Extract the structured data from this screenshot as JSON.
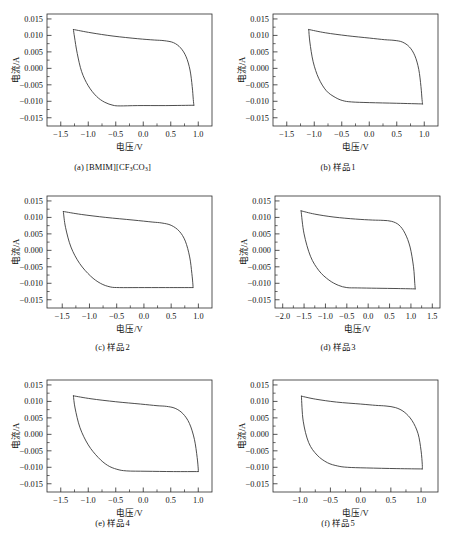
{
  "figure": {
    "axis_labels": {
      "x": "电压/V",
      "y": "电流/A"
    },
    "bottom_caption": ""
  },
  "chart_data": [
    {
      "type": "line",
      "panel": "a",
      "caption_prefix": "(a)",
      "caption": "[BMIM][CF3CO3]",
      "caption_html": "[BMIM][CF<sub>3</sub>CO<sub>3</sub>]",
      "title": "",
      "xlabel": "电压/V",
      "ylabel": "电流/A",
      "xlim": [
        -1.75,
        1.25
      ],
      "ylim": [
        -0.0175,
        0.0165
      ],
      "xticks": [
        -1.5,
        -1.0,
        -0.5,
        0.0,
        0.5,
        1.0
      ],
      "xticklabels": [
        "-1.5",
        "-1.0",
        "-0.5",
        "0.0",
        "0.5",
        "1.0"
      ],
      "yticks": [
        0.015,
        0.01,
        0.005,
        0.0,
        -0.005,
        -0.01,
        -0.015
      ],
      "yticklabels": [
        "0.015",
        "0.010",
        "0.005",
        "0.000",
        "-0.005",
        "-0.010",
        "-0.015"
      ],
      "grid": false,
      "legend": null,
      "series": [
        {
          "name": "cv-loop",
          "upper_branch": [
            [
              -1.27,
              0.0118
            ],
            [
              -0.95,
              0.0108
            ],
            [
              -0.55,
              0.0098
            ],
            [
              -0.1,
              0.009
            ],
            [
              0.2,
              0.0086
            ],
            [
              0.38,
              0.0084
            ],
            [
              0.55,
              0.0078
            ],
            [
              0.68,
              0.0062
            ],
            [
              0.78,
              0.0035
            ],
            [
              0.85,
              -0.0005
            ],
            [
              0.89,
              -0.0055
            ],
            [
              0.91,
              -0.0095
            ],
            [
              0.92,
              -0.0112
            ]
          ],
          "lower_branch": [
            [
              0.92,
              -0.0112
            ],
            [
              0.4,
              -0.0113
            ],
            [
              -0.1,
              -0.0113
            ],
            [
              -0.42,
              -0.0114
            ],
            [
              -0.55,
              -0.0112
            ],
            [
              -0.7,
              -0.0103
            ],
            [
              -0.85,
              -0.0085
            ],
            [
              -1.0,
              -0.0053
            ],
            [
              -1.12,
              -0.001
            ],
            [
              -1.2,
              0.0045
            ],
            [
              -1.25,
              0.0095
            ],
            [
              -1.27,
              0.0118
            ]
          ]
        }
      ]
    },
    {
      "type": "line",
      "panel": "b",
      "caption_prefix": "(b)",
      "caption": "样品1",
      "caption_html": "样品1",
      "title": "",
      "xlabel": "电压/V",
      "ylabel": "电流/A",
      "xlim": [
        -1.75,
        1.25
      ],
      "ylim": [
        -0.0175,
        0.0165
      ],
      "xticks": [
        -1.5,
        -1.0,
        -0.5,
        0.0,
        0.5,
        1.0
      ],
      "xticklabels": [
        "-1.5",
        "-1.0",
        "-0.5",
        "0.0",
        "0.5",
        "1.0"
      ],
      "yticks": [
        0.015,
        0.01,
        0.005,
        0.0,
        -0.005,
        -0.01,
        -0.015
      ],
      "yticklabels": [
        "0.015",
        "0.010",
        "0.005",
        "0.000",
        "-0.005",
        "-0.010",
        "-0.015"
      ],
      "grid": false,
      "legend": null,
      "series": [
        {
          "name": "cv-loop",
          "upper_branch": [
            [
              -1.1,
              0.0118
            ],
            [
              -0.8,
              0.0108
            ],
            [
              -0.4,
              0.0099
            ],
            [
              0.0,
              0.0092
            ],
            [
              0.28,
              0.0087
            ],
            [
              0.45,
              0.0085
            ],
            [
              0.6,
              0.008
            ],
            [
              0.73,
              0.0065
            ],
            [
              0.83,
              0.0038
            ],
            [
              0.9,
              -0.0003
            ],
            [
              0.94,
              -0.0055
            ],
            [
              0.96,
              -0.0095
            ],
            [
              0.97,
              -0.0108
            ]
          ],
          "lower_branch": [
            [
              0.97,
              -0.0108
            ],
            [
              0.5,
              -0.0106
            ],
            [
              0.0,
              -0.0104
            ],
            [
              -0.32,
              -0.0102
            ],
            [
              -0.48,
              -0.0098
            ],
            [
              -0.62,
              -0.0088
            ],
            [
              -0.78,
              -0.0068
            ],
            [
              -0.92,
              -0.003
            ],
            [
              -1.02,
              0.002
            ],
            [
              -1.08,
              0.008
            ],
            [
              -1.1,
              0.0118
            ]
          ]
        }
      ]
    },
    {
      "type": "line",
      "panel": "c",
      "caption_prefix": "(c)",
      "caption": "样品2",
      "caption_html": "样品2",
      "title": "",
      "xlabel": "电压/V",
      "ylabel": "电流/A",
      "xlim": [
        -1.78,
        1.25
      ],
      "ylim": [
        -0.0175,
        0.0165
      ],
      "xticks": [
        -1.5,
        -1.0,
        -0.5,
        0.0,
        0.5,
        1.0
      ],
      "xticklabels": [
        "-1.5",
        "-1.0",
        "-0.5",
        "0.0",
        "0.5",
        "1.0"
      ],
      "yticks": [
        0.015,
        0.01,
        0.005,
        0.0,
        -0.005,
        -0.01,
        -0.015
      ],
      "yticklabels": [
        "0.015",
        "0.010",
        "0.005",
        "0.000",
        "-0.005",
        "-0.010",
        "-0.015"
      ],
      "grid": false,
      "legend": null,
      "series": [
        {
          "name": "cv-loop",
          "upper_branch": [
            [
              -1.48,
              0.0118
            ],
            [
              -1.15,
              0.0109
            ],
            [
              -0.7,
              0.01
            ],
            [
              -0.2,
              0.0092
            ],
            [
              0.15,
              0.0086
            ],
            [
              0.33,
              0.0083
            ],
            [
              0.5,
              0.0076
            ],
            [
              0.65,
              0.0058
            ],
            [
              0.76,
              0.0028
            ],
            [
              0.84,
              -0.002
            ],
            [
              0.88,
              -0.007
            ],
            [
              0.9,
              -0.0105
            ],
            [
              0.9,
              -0.0113
            ]
          ],
          "lower_branch": [
            [
              0.9,
              -0.0113
            ],
            [
              0.4,
              -0.0113
            ],
            [
              -0.1,
              -0.0113
            ],
            [
              -0.45,
              -0.0113
            ],
            [
              -0.62,
              -0.0111
            ],
            [
              -0.8,
              -0.01
            ],
            [
              -0.98,
              -0.0078
            ],
            [
              -1.18,
              -0.004
            ],
            [
              -1.34,
              0.001
            ],
            [
              -1.44,
              0.007
            ],
            [
              -1.48,
              0.0118
            ]
          ]
        }
      ]
    },
    {
      "type": "line",
      "panel": "d",
      "caption_prefix": "(d)",
      "caption": "样品3",
      "caption_html": "样品3",
      "title": "",
      "xlabel": "电压/V",
      "ylabel": "电流/A",
      "xlim": [
        -2.18,
        1.68
      ],
      "ylim": [
        -0.0175,
        0.0165
      ],
      "xticks": [
        -2.0,
        -1.5,
        -1.0,
        -0.5,
        0.0,
        0.5,
        1.0,
        1.5
      ],
      "xticklabels": [
        "-2.0",
        "-1.5",
        "-1.0",
        "-0.5",
        "0.0",
        "0.5",
        "1.0",
        "1.5"
      ],
      "yticks": [
        0.015,
        0.01,
        0.005,
        0.0,
        -0.005,
        -0.01,
        -0.015
      ],
      "yticklabels": [
        "0.015",
        "0.010",
        "0.005",
        "0.000",
        "-0.005",
        "-0.010",
        "-0.015"
      ],
      "grid": false,
      "legend": null,
      "series": [
        {
          "name": "cv-loop",
          "upper_branch": [
            [
              -1.57,
              0.012
            ],
            [
              -1.25,
              0.011
            ],
            [
              -0.8,
              0.0101
            ],
            [
              -0.3,
              0.0095
            ],
            [
              0.1,
              0.0092
            ],
            [
              0.35,
              0.0091
            ],
            [
              0.55,
              0.0088
            ],
            [
              0.72,
              0.0077
            ],
            [
              0.86,
              0.0052
            ],
            [
              0.98,
              0.001
            ],
            [
              1.06,
              -0.005
            ],
            [
              1.09,
              -0.01
            ],
            [
              1.1,
              -0.0117
            ]
          ],
          "lower_branch": [
            [
              1.1,
              -0.0117
            ],
            [
              0.7,
              -0.0116
            ],
            [
              0.2,
              -0.0115
            ],
            [
              -0.25,
              -0.0114
            ],
            [
              -0.5,
              -0.0113
            ],
            [
              -0.7,
              -0.0106
            ],
            [
              -0.92,
              -0.009
            ],
            [
              -1.15,
              -0.0062
            ],
            [
              -1.35,
              -0.0018
            ],
            [
              -1.5,
              0.005
            ],
            [
              -1.57,
              0.012
            ]
          ]
        }
      ]
    },
    {
      "type": "line",
      "panel": "e",
      "caption_prefix": "(e)",
      "caption": "样品4",
      "caption_html": "样品4",
      "title": "",
      "xlabel": "电压/V",
      "ylabel": "电流/A",
      "xlim": [
        -1.75,
        1.25
      ],
      "ylim": [
        -0.0175,
        0.0165
      ],
      "xticks": [
        -1.5,
        -1.0,
        -0.5,
        0.0,
        0.5,
        1.0
      ],
      "xticklabels": [
        "-1.5",
        "-1.0",
        "-0.5",
        "0.0",
        "0.5",
        "1.0"
      ],
      "yticks": [
        0.015,
        0.01,
        0.005,
        0.0,
        -0.005,
        -0.01,
        -0.015
      ],
      "yticklabels": [
        "0.015",
        "0.010",
        "0.005",
        "0.000",
        "-0.005",
        "-0.010",
        "-0.015"
      ],
      "grid": false,
      "legend": null,
      "series": [
        {
          "name": "cv-loop",
          "upper_branch": [
            [
              -1.27,
              0.0117
            ],
            [
              -0.95,
              0.0108
            ],
            [
              -0.5,
              0.0099
            ],
            [
              -0.05,
              0.0092
            ],
            [
              0.25,
              0.0087
            ],
            [
              0.42,
              0.0085
            ],
            [
              0.58,
              0.0079
            ],
            [
              0.72,
              0.0063
            ],
            [
              0.84,
              0.0033
            ],
            [
              0.93,
              -0.0015
            ],
            [
              0.98,
              -0.007
            ],
            [
              1.0,
              -0.0105
            ],
            [
              1.0,
              -0.0113
            ]
          ],
          "lower_branch": [
            [
              1.0,
              -0.0113
            ],
            [
              0.55,
              -0.0113
            ],
            [
              0.05,
              -0.0112
            ],
            [
              -0.3,
              -0.0111
            ],
            [
              -0.48,
              -0.0106
            ],
            [
              -0.65,
              -0.0094
            ],
            [
              -0.82,
              -0.007
            ],
            [
              -1.0,
              -0.0032
            ],
            [
              -1.15,
              0.002
            ],
            [
              -1.24,
              0.008
            ],
            [
              -1.27,
              0.0117
            ]
          ]
        }
      ]
    },
    {
      "type": "line",
      "panel": "f",
      "caption_prefix": "(f)",
      "caption": "样品5",
      "caption_html": "样品5",
      "title": "",
      "xlabel": "电压/V",
      "ylabel": "电流/A",
      "xlim": [
        -1.45,
        1.28
      ],
      "ylim": [
        -0.0175,
        0.0165
      ],
      "xticks": [
        -1.0,
        -0.5,
        0.0,
        0.5,
        1.0
      ],
      "xticklabels": [
        "-1.0",
        "-0.5",
        "0.0",
        "0.5",
        "1.0"
      ],
      "yticks": [
        0.015,
        0.01,
        0.005,
        0.0,
        -0.005,
        -0.01,
        -0.015
      ],
      "yticklabels": [
        "0.015",
        "0.010",
        "0.005",
        "0.000",
        "-0.005",
        "-0.010",
        "-0.015"
      ],
      "grid": false,
      "legend": null,
      "series": [
        {
          "name": "cv-loop",
          "upper_branch": [
            [
              -0.98,
              0.0116
            ],
            [
              -0.75,
              0.0107
            ],
            [
              -0.4,
              0.0098
            ],
            [
              0.0,
              0.0092
            ],
            [
              0.25,
              0.0088
            ],
            [
              0.42,
              0.0086
            ],
            [
              0.58,
              0.0081
            ],
            [
              0.72,
              0.0068
            ],
            [
              0.85,
              0.0042
            ],
            [
              0.95,
              0.0002
            ],
            [
              1.0,
              -0.005
            ],
            [
              1.02,
              -0.0092
            ],
            [
              1.02,
              -0.0105
            ]
          ],
          "lower_branch": [
            [
              1.02,
              -0.0105
            ],
            [
              0.6,
              -0.0104
            ],
            [
              0.1,
              -0.0102
            ],
            [
              -0.22,
              -0.01
            ],
            [
              -0.38,
              -0.0096
            ],
            [
              -0.55,
              -0.0086
            ],
            [
              -0.72,
              -0.0063
            ],
            [
              -0.86,
              -0.0025
            ],
            [
              -0.95,
              0.004
            ],
            [
              -0.98,
              0.0116
            ]
          ]
        }
      ]
    }
  ]
}
